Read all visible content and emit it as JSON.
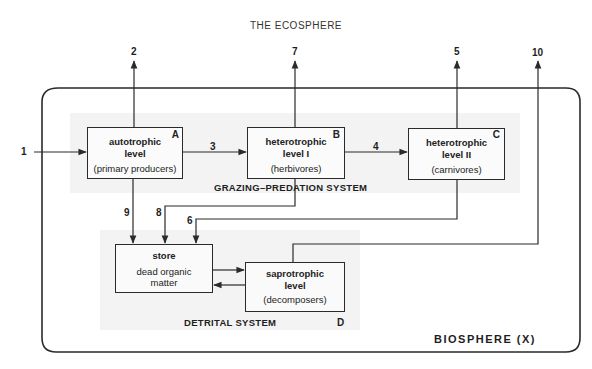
{
  "title": "THE ECOSPHERE",
  "boundary": {
    "label": "BIOSPHERE (X)"
  },
  "nodes": {
    "A": {
      "letter": "A",
      "line1": "autotrophic",
      "line2": "level",
      "sub": "(primary producers)"
    },
    "B": {
      "letter": "B",
      "line1": "heterotrophic",
      "line2": "level I",
      "sub": "(herbivores)"
    },
    "C": {
      "letter": "C",
      "line1": "heterotrophic",
      "line2": "level II",
      "sub": "(carnivores)"
    },
    "store": {
      "line1": "store",
      "sub1": "dead organic",
      "sub2": "matter"
    },
    "D": {
      "letter": "D",
      "line1": "saprotrophic",
      "line2": "level",
      "sub": "(decomposers)"
    }
  },
  "systems": {
    "grazing": "GRAZING–PREDATION  SYSTEM",
    "detrital": "DETRITAL SYSTEM"
  },
  "flows": [
    {
      "id": "1",
      "label": "1",
      "from": "external",
      "to": "A"
    },
    {
      "id": "2",
      "label": "2",
      "from": "A",
      "to": "external"
    },
    {
      "id": "3",
      "label": "3",
      "from": "A",
      "to": "B"
    },
    {
      "id": "4",
      "label": "4",
      "from": "B",
      "to": "C"
    },
    {
      "id": "5",
      "label": "5",
      "from": "C",
      "to": "external"
    },
    {
      "id": "6",
      "label": "6",
      "from": "C",
      "to": "store"
    },
    {
      "id": "7",
      "label": "7",
      "from": "B",
      "to": "external"
    },
    {
      "id": "8",
      "label": "8",
      "from": "B",
      "to": "store"
    },
    {
      "id": "9",
      "label": "9",
      "from": "A",
      "to": "store"
    },
    {
      "id": "10",
      "label": "10",
      "from": "D",
      "to": "external"
    }
  ],
  "colors": {
    "line": "#2a2a2a",
    "shade": "#f3f3f3",
    "background": "#ffffff"
  }
}
